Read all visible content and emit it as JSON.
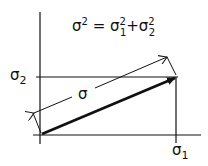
{
  "diagram": {
    "equation": {
      "lhs": "σ",
      "lhs_exp": "2",
      "eq": " = ",
      "t1": "σ",
      "t1_sub": "1",
      "t1_exp": "2",
      "plus": "+",
      "t2": "σ",
      "t2_sub": "2",
      "t2_exp": "2"
    },
    "labels": {
      "y_axis_component": "σ",
      "y_axis_sub": "2",
      "x_axis_component": "σ",
      "x_axis_sub": "1",
      "resultant": "σ"
    },
    "colors": {
      "ink": "#111111",
      "background": "#ffffff"
    }
  }
}
